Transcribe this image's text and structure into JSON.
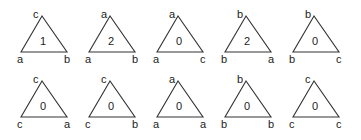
{
  "diagram": {
    "rows": [
      {
        "triangles": [
          {
            "top": "c",
            "left": "a",
            "right": "b",
            "count": "1"
          },
          {
            "top": "a",
            "left": "a",
            "right": "b",
            "count": "2"
          },
          {
            "top": "a",
            "left": "a",
            "right": "c",
            "count": "0"
          },
          {
            "top": "b",
            "left": "b",
            "right": "a",
            "count": "2"
          },
          {
            "top": "b",
            "left": "b",
            "right": "c",
            "count": "0"
          }
        ]
      },
      {
        "triangles": [
          {
            "top": "c",
            "left": "c",
            "right": "a",
            "count": "0"
          },
          {
            "top": "c",
            "left": "c",
            "right": "b",
            "count": "0"
          },
          {
            "top": "a",
            "left": "a",
            "right": "a",
            "count": "0"
          },
          {
            "top": "b",
            "left": "b",
            "right": "b",
            "count": "0"
          },
          {
            "top": "c",
            "left": "c",
            "right": "c",
            "count": "0"
          }
        ]
      }
    ]
  }
}
